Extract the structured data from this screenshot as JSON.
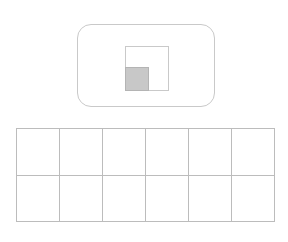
{
  "figure": {
    "background_color": "#ffffff",
    "width": 288,
    "height": 242
  },
  "rounded_panel": {
    "name": "rounded rectangle",
    "shape": "rounded-rectangle",
    "x": 77,
    "y": 24,
    "width": 138,
    "height": 83,
    "corner_radius": 14,
    "stroke_color": "#c9c9c9",
    "fill_color": "#ffffff",
    "stroke_width": 1
  },
  "outline_square": {
    "name": "outlined square",
    "shape": "square",
    "x": 124,
    "y": 45,
    "width": 44,
    "height": 45,
    "stroke_color": "#c9c9c9",
    "fill_color": "#ffffff",
    "stroke_width": 1
  },
  "filled_square": {
    "name": "gray filled square",
    "shape": "square",
    "x": 124,
    "y": 66,
    "width": 24,
    "height": 24,
    "stroke_color": "#b4b4b4",
    "fill_color": "#c8c8c8",
    "stroke_width": 1
  },
  "grid": {
    "name": "grid table",
    "x": 16,
    "y": 128,
    "width": 259,
    "height": 94,
    "columns": 6,
    "rows": 2,
    "line_color": "#bcbcbc",
    "cell_fill": "#ffffff",
    "cells": [
      [
        "",
        "",
        "",
        "",
        "",
        ""
      ],
      [
        "",
        "",
        "",
        "",
        "",
        ""
      ]
    ]
  }
}
